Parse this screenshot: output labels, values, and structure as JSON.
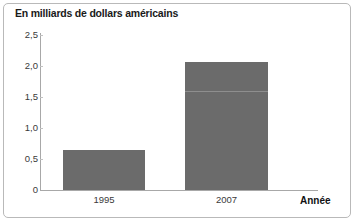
{
  "figure": {
    "title": "En milliards de dollars américains",
    "frame_border_color": "#b9b9b9",
    "background_color": "#ffffff"
  },
  "chart_data": {
    "type": "bar",
    "title": "En milliards de dollars américains",
    "xlabel": "Année",
    "ylabel": "",
    "categories": [
      "1995",
      "2007"
    ],
    "values": [
      0.65,
      2.07
    ],
    "bar_color": "#6b6b6b",
    "ylim": [
      0,
      2.5
    ],
    "yticks": [
      0,
      0.5,
      1.0,
      1.5,
      2.0,
      2.5
    ],
    "ytick_labels": [
      "0",
      "0,5",
      "1,0",
      "1,5",
      "2,0",
      "2,5"
    ],
    "grid": false,
    "legend": null,
    "annotations": [
      {
        "type": "hairline",
        "y": 1.6,
        "series_index": 1,
        "color": "#8e8e8e"
      }
    ]
  },
  "axes": {
    "y_labels": [
      "2,5",
      "2,0",
      "1,5",
      "1,0",
      "0,5",
      "0"
    ],
    "x_labels": [
      "1995",
      "2007"
    ],
    "x_axis_title": "Année"
  }
}
